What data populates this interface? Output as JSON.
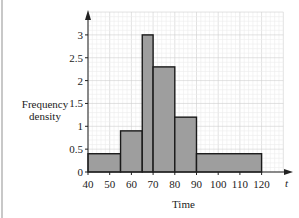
{
  "chart_data": {
    "type": "histogram",
    "title": "",
    "xlabel": "Time",
    "ylabel": "Frequency density",
    "x_axis_symbol": "t",
    "xlim": [
      40,
      130
    ],
    "ylim": [
      0,
      3.5
    ],
    "grid": true,
    "x_ticks": [
      40,
      50,
      60,
      70,
      80,
      90,
      100,
      110,
      120
    ],
    "y_ticks": [
      0,
      0.5,
      1,
      1.5,
      2,
      2.5,
      3
    ],
    "bins": [
      {
        "from": 40,
        "to": 55,
        "density": 0.4
      },
      {
        "from": 55,
        "to": 65,
        "density": 0.9
      },
      {
        "from": 65,
        "to": 70,
        "density": 3.0
      },
      {
        "from": 70,
        "to": 80,
        "density": 2.3
      },
      {
        "from": 80,
        "to": 90,
        "density": 1.2
      },
      {
        "from": 90,
        "to": 120,
        "density": 0.4
      }
    ],
    "bar_color": "#9e9e9e",
    "grid_color": "#dcdcdc"
  },
  "labels": {
    "ylabel_line1": "Frequency",
    "ylabel_line2": "density",
    "xlabel": "Time",
    "axis_symbol": "t"
  }
}
